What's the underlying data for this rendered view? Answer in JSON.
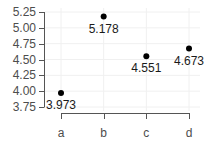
{
  "chart_data": {
    "type": "scatter",
    "title": "",
    "xlabel": "",
    "ylabel": "",
    "categories": [
      "a",
      "b",
      "c",
      "d"
    ],
    "values": [
      3.973,
      5.178,
      4.551,
      4.673
    ],
    "data_labels": [
      "3.973",
      "5.178",
      "4.551",
      "4.673"
    ],
    "y_ticks": [
      3.75,
      4.0,
      4.25,
      4.5,
      4.75,
      5.0,
      5.25
    ],
    "y_tick_labels": [
      "3.75",
      "4.00",
      "4.25",
      "4.50",
      "4.75",
      "5.00",
      "5.25"
    ],
    "ylim": [
      3.75,
      5.25
    ],
    "grid": true,
    "legend": null,
    "colors": {
      "point": "#000000",
      "axis": "#555555",
      "grid": "#f0f0f0",
      "tick_text": "#4d4d4d"
    }
  }
}
